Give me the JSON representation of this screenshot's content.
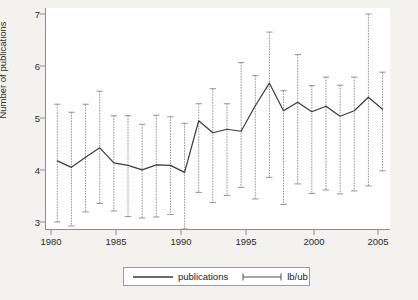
{
  "chart_data": {
    "type": "line",
    "title": "",
    "xlabel": "",
    "ylabel": "Number of publications",
    "xlim": [
      1981.2,
      2005.6
    ],
    "ylim": [
      2.72,
      7.15
    ],
    "xticks": [
      1980,
      1985,
      1990,
      1995,
      2000,
      2005
    ],
    "yticks": [
      3,
      4,
      5,
      6,
      7
    ],
    "grid": false,
    "legend_position": "below-center",
    "x": [
      1982,
      1983,
      1984,
      1985,
      1986,
      1987,
      1988,
      1989,
      1990,
      1991,
      1992,
      1993,
      1994,
      1995,
      1996,
      1997,
      1998,
      1999,
      2000,
      2001,
      2002,
      2003,
      2004,
      2005
    ],
    "series": [
      {
        "name": "publications",
        "values": [
          4.1,
          3.97,
          4.17,
          4.36,
          4.06,
          4.01,
          3.92,
          4.02,
          4.01,
          3.87,
          4.9,
          4.66,
          4.73,
          4.69,
          5.2,
          5.65,
          5.1,
          5.27,
          5.08,
          5.19,
          4.99,
          5.1,
          5.37,
          5.13
        ]
      },
      {
        "name": "lb",
        "values": [
          2.88,
          2.8,
          3.08,
          3.25,
          3.1,
          2.99,
          2.96,
          2.98,
          3.03,
          2.74,
          3.47,
          3.27,
          3.41,
          3.57,
          3.34,
          3.77,
          3.23,
          3.64,
          3.45,
          3.52,
          3.44,
          3.5,
          3.6,
          3.9
        ]
      },
      {
        "name": "ub",
        "values": [
          5.23,
          5.07,
          5.23,
          5.49,
          5.0,
          5.0,
          4.83,
          5.01,
          4.98,
          4.85,
          5.24,
          5.54,
          5.24,
          6.06,
          5.8,
          6.67,
          5.5,
          6.22,
          5.6,
          5.77,
          5.61,
          5.77,
          7.03,
          5.87
        ]
      }
    ],
    "legend": [
      {
        "key": "publications",
        "label": "publications",
        "style": "line"
      },
      {
        "key": "lb/ub",
        "label": "lb/ub",
        "style": "capped-range"
      }
    ]
  },
  "axis": {
    "y_labels": [
      "7",
      "6",
      "5",
      "4",
      "3"
    ],
    "x_labels": [
      "1980",
      "1985",
      "1990",
      "1995",
      "2000",
      "2005"
    ],
    "y_title": "Number of publications"
  },
  "legend": {
    "publications_label": "publications",
    "lbub_label": "lb/ub"
  },
  "colors": {
    "line": "#3a3a3a",
    "errorbar": "#8a8a8a",
    "axis": "#8d8d8d",
    "plot_bg": "#ffffff",
    "figure_bg": "#f3f2ef",
    "text": "#2b2b2b"
  }
}
